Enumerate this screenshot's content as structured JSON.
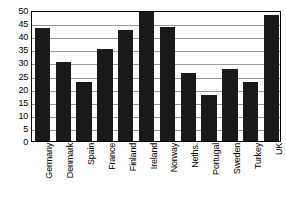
{
  "chart_data": {
    "type": "bar",
    "title": "",
    "xlabel": "",
    "ylabel": "",
    "ylim": [
      0,
      50
    ],
    "ytick_step": 5,
    "yticks": [
      50,
      45,
      40,
      35,
      30,
      25,
      20,
      15,
      10,
      5,
      0
    ],
    "grid": true,
    "legend": false,
    "bar_color": "#1a1a1a",
    "gridline_color": "#9a9a9a",
    "frame_color": "#000000",
    "background_color": "#ffffff",
    "xtick_rotation": 90,
    "categories": [
      "Germany",
      "Denmark",
      "Spain",
      "France",
      "Finland",
      "Ireland",
      "Norway",
      "Neths.",
      "Portugal",
      "Sweden",
      "Turkey",
      "UK"
    ],
    "values": [
      43,
      30,
      22.5,
      35,
      42.5,
      50,
      43.5,
      26,
      17.5,
      27.5,
      22.5,
      48
    ]
  }
}
